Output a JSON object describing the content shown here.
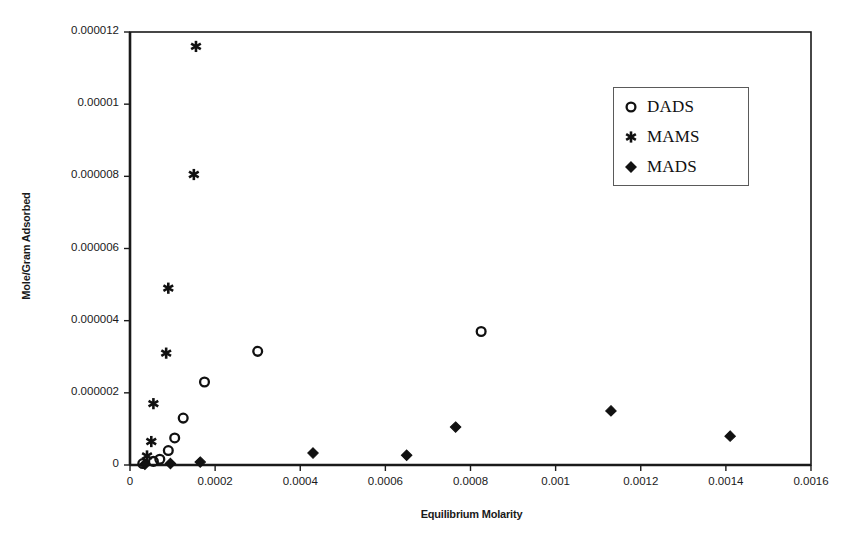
{
  "chart_data": {
    "type": "scatter",
    "title": "",
    "xlabel": "Equilibrium Molarity",
    "ylabel": "Mole/Gram Adsorbed",
    "xlim": [
      0,
      0.0016
    ],
    "ylim": [
      0,
      1.2e-05
    ],
    "grid": false,
    "legend_position": "upper-right",
    "xticks": [
      0,
      0.0002,
      0.0004,
      0.0006,
      0.0008,
      0.001,
      0.0012,
      0.0014,
      0.0016
    ],
    "xtick_labels": [
      "0",
      "0.0002",
      "0.0004",
      "0.0006",
      "0.0008",
      "0.001",
      "0.0012",
      "0.0014",
      "0.0016"
    ],
    "yticks": [
      0,
      2e-06,
      4e-06,
      6e-06,
      8e-06,
      1e-05,
      1.2e-05
    ],
    "ytick_labels": [
      "0",
      "0.000002",
      "0.000004",
      "0.000006",
      "0.000008",
      "0.00001",
      "0.000012"
    ],
    "series": [
      {
        "name": "DADS",
        "marker": "open-circle",
        "color": "#111111",
        "points": [
          {
            "x": 3e-05,
            "y": 4e-08
          },
          {
            "x": 5.5e-05,
            "y": 1e-07
          },
          {
            "x": 7e-05,
            "y": 1.6e-07
          },
          {
            "x": 9e-05,
            "y": 4e-07
          },
          {
            "x": 0.000105,
            "y": 7.5e-07
          },
          {
            "x": 0.000125,
            "y": 1.3e-06
          },
          {
            "x": 0.000175,
            "y": 2.3e-06
          },
          {
            "x": 0.0003,
            "y": 3.15e-06
          },
          {
            "x": 0.000825,
            "y": 3.7e-06
          }
        ]
      },
      {
        "name": "MAMS",
        "marker": "asterisk",
        "color": "#111111",
        "points": [
          {
            "x": 4e-05,
            "y": 2.5e-07
          },
          {
            "x": 5e-05,
            "y": 6.5e-07
          },
          {
            "x": 5.5e-05,
            "y": 1.7e-06
          },
          {
            "x": 8.5e-05,
            "y": 3.1e-06
          },
          {
            "x": 9e-05,
            "y": 4.9e-06
          },
          {
            "x": 0.00015,
            "y": 8.05e-06
          },
          {
            "x": 0.000155,
            "y": 1.16e-05
          }
        ]
      },
      {
        "name": "MADS",
        "marker": "filled-diamond",
        "color": "#111111",
        "points": [
          {
            "x": 3.5e-05,
            "y": 2e-08
          },
          {
            "x": 9.5e-05,
            "y": 4e-08
          },
          {
            "x": 0.000165,
            "y": 8e-08
          },
          {
            "x": 0.00043,
            "y": 3.3e-07
          },
          {
            "x": 0.00065,
            "y": 2.7e-07
          },
          {
            "x": 0.000765,
            "y": 1.05e-06
          },
          {
            "x": 0.00113,
            "y": 1.5e-06
          },
          {
            "x": 0.00141,
            "y": 8e-07
          }
        ]
      }
    ]
  },
  "legend": {
    "entries": [
      {
        "label": "DADS",
        "marker": "open-circle"
      },
      {
        "label": "MAMS",
        "marker": "asterisk"
      },
      {
        "label": "MADS",
        "marker": "filled-diamond"
      }
    ]
  },
  "axes": {
    "x_title": "Equilibrium Molarity",
    "y_title": "Mole/Gram Adsorbed"
  }
}
